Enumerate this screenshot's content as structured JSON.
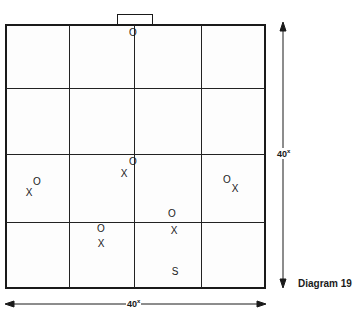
{
  "diagram": {
    "caption": "Diagram 19",
    "field": {
      "grid": {
        "columns": 4,
        "rows": 4
      },
      "goal_position": "top-center"
    },
    "dimensions": {
      "width_label": "40",
      "width_unit": "x",
      "height_label": "40",
      "height_unit": "x"
    },
    "markers": [
      {
        "symbol": "O",
        "role": "player-o",
        "x": 133,
        "y": 33
      },
      {
        "symbol": "O",
        "role": "player-o",
        "x": 37,
        "y": 182
      },
      {
        "symbol": "X",
        "role": "player-x",
        "x": 29,
        "y": 193
      },
      {
        "symbol": "O",
        "role": "player-o",
        "x": 133,
        "y": 162
      },
      {
        "symbol": "X",
        "role": "player-x",
        "x": 124,
        "y": 174
      },
      {
        "symbol": "O",
        "role": "player-o",
        "x": 227,
        "y": 180
      },
      {
        "symbol": "X",
        "role": "player-x",
        "x": 235,
        "y": 189
      },
      {
        "symbol": "O",
        "role": "player-o",
        "x": 101,
        "y": 229
      },
      {
        "symbol": "X",
        "role": "player-x",
        "x": 101,
        "y": 244
      },
      {
        "symbol": "O",
        "role": "player-o",
        "x": 172,
        "y": 214
      },
      {
        "symbol": "X",
        "role": "player-x",
        "x": 174,
        "y": 231
      },
      {
        "symbol": "S",
        "role": "server",
        "x": 175,
        "y": 272
      }
    ]
  }
}
